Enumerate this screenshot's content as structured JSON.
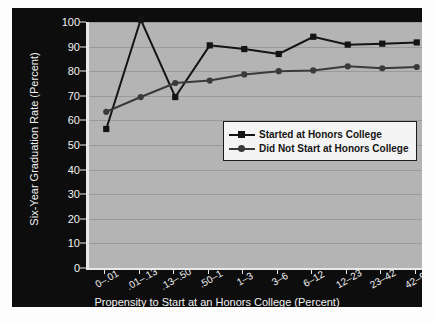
{
  "chart_data": {
    "type": "line",
    "title": "",
    "xlabel": "Propensity to Start at an Honors College (Percent)",
    "ylabel": "Six-Year Graduation Rate (Percent)",
    "categories": [
      "0–.01",
      ".01–.13",
      ".13–.50",
      ".50–1",
      "1–3",
      "3–6",
      "6–12",
      "12–23",
      "23–42",
      "42–97"
    ],
    "ylim": [
      0,
      100
    ],
    "yticks": [
      0,
      10,
      20,
      30,
      40,
      50,
      60,
      70,
      80,
      90,
      100
    ],
    "ytick_labels": [
      "0",
      "10",
      "20",
      "30",
      "40",
      "50",
      "60",
      "70",
      "80",
      "90",
      "100"
    ],
    "grid": true,
    "legend_position": "center-right-inside",
    "series": [
      {
        "name": "Started at Honors College",
        "marker": "square",
        "color": "#141414",
        "values": [
          56.5,
          101.0,
          69.5,
          90.5,
          89.0,
          87.0,
          94.0,
          90.8,
          91.2,
          91.7
        ]
      },
      {
        "name": "Did Not Start at Honors College",
        "marker": "circle",
        "color": "#3a3a3a",
        "values": [
          63.5,
          69.5,
          75.2,
          76.2,
          78.7,
          80.0,
          80.3,
          82.0,
          81.2,
          81.7
        ]
      }
    ]
  },
  "legend": {
    "entries": [
      {
        "label": "Started at Honors College"
      },
      {
        "label": "Did Not Start at Honors College"
      }
    ]
  },
  "colors": {
    "panel_background": "#0d0d0d",
    "plot_background": "#b4b4b4",
    "axis": "#e8e8e8",
    "gridline": "#9a9a9a",
    "text_light": "#f2f2f2",
    "series_one": "#141414",
    "series_two": "#3a3a3a",
    "legend_background": "#f4f4f4"
  }
}
